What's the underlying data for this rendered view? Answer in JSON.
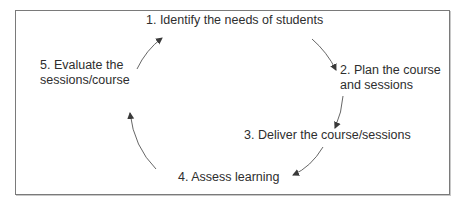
{
  "diagram": {
    "type": "cycle",
    "steps": [
      {
        "number": "1.",
        "lines": [
          "1. Identify the needs of students"
        ]
      },
      {
        "number": "2.",
        "lines": [
          "2. Plan the course",
          "and sessions"
        ]
      },
      {
        "number": "3.",
        "lines": [
          "3. Deliver the course/sessions"
        ]
      },
      {
        "number": "4.",
        "lines": [
          "4. Assess learning"
        ]
      },
      {
        "number": "5.",
        "lines": [
          "5. Evaluate the",
          "sessions/course"
        ]
      }
    ],
    "edges": [
      {
        "from": 1,
        "to": 2
      },
      {
        "from": 2,
        "to": 3
      },
      {
        "from": 3,
        "to": 4
      },
      {
        "from": 4,
        "to": 5
      },
      {
        "from": 5,
        "to": 1
      }
    ],
    "colors": {
      "border": "#7a7a7a",
      "text": "#2e2e2e",
      "arrow": "#4a4a4a"
    }
  }
}
